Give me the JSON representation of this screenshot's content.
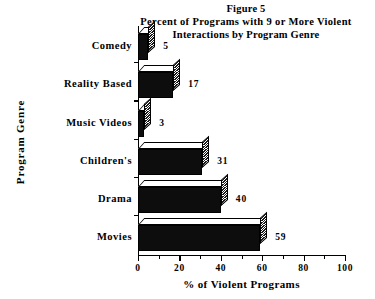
{
  "chart_data": {
    "type": "bar",
    "orientation": "horizontal",
    "title": "Figure 5",
    "subtitle_line1": "Percent of Programs with 9 or More Violent",
    "subtitle_line2": "Interactions by Program Genre",
    "xlabel": "% of Violent Programs",
    "ylabel": "Program Genre",
    "categories": [
      "Comedy",
      "Reality Based",
      "Music Videos",
      "Children's",
      "Drama",
      "Movies"
    ],
    "values": [
      5,
      17,
      3,
      31,
      40,
      59
    ],
    "value_labels": [
      "5",
      "17",
      "3",
      "31",
      "40",
      "59"
    ],
    "xlim": [
      0,
      100
    ],
    "xticks": [
      0,
      20,
      40,
      60,
      80,
      100
    ],
    "xtick_labels": [
      "0",
      "20",
      "40",
      "60",
      "80",
      "100"
    ],
    "xminor_ticks": [
      10,
      30,
      50,
      70,
      90
    ],
    "grid": false,
    "legend": null,
    "bar_color": "#0d0d0d",
    "bar_top_color": "#ffffff",
    "background": "#ffffff"
  }
}
